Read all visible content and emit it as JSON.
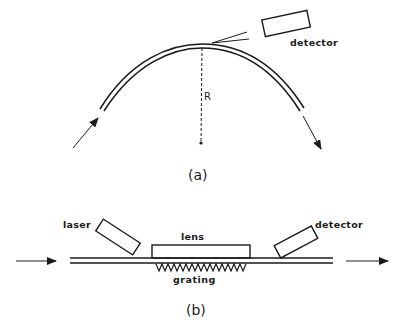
{
  "panel_a": {
    "caption": "(a)",
    "labels": {
      "detector": "detector",
      "radius": "R"
    }
  },
  "panel_b": {
    "caption": "(b)",
    "labels": {
      "laser": "laser",
      "lens": "lens",
      "detector": "detector",
      "grating": "grating"
    }
  },
  "colors": {
    "ink": "#1a1a1a",
    "background": "#ffffff"
  }
}
